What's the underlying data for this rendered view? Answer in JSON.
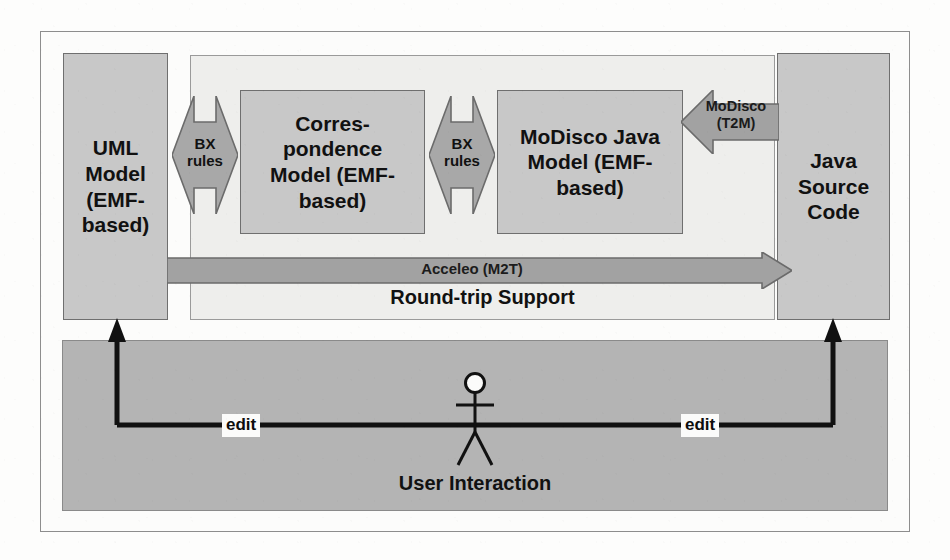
{
  "diagram": {
    "colors": {
      "page_background": "#fdfdfc",
      "model_box_fill": "#c8c8c8",
      "model_box_stroke": "#6f6f6f",
      "container_fill": "#eeeeec",
      "container_stroke": "#9a9a9a",
      "arrow_fill": "#a8a8a8",
      "arrow_stroke": "#6b6b6b",
      "band_fill": "#b4b4b4",
      "band_stroke": "#8a8a8a",
      "connector_stroke": "#111111",
      "text": "#111111"
    },
    "boxes": [
      {
        "id": "uml",
        "label": "UML\nModel\n(EMF-\nbased)"
      },
      {
        "id": "corr",
        "label": "Corres-\npondence\nModel (EMF-\nbased)"
      },
      {
        "id": "modisco",
        "label": "MoDisco Java\nModel (EMF-\nbased)"
      },
      {
        "id": "java",
        "label": "Java\nSource\nCode"
      }
    ],
    "container": {
      "caption": "Round-trip Support"
    },
    "arrows": [
      {
        "id": "bx-1",
        "label": "BX\nrules",
        "kind": "bidirectional"
      },
      {
        "id": "bx-2",
        "label": "BX\nrules",
        "kind": "bidirectional"
      },
      {
        "id": "modisco",
        "label": "MoDisco\n(T2M)",
        "kind": "left"
      },
      {
        "id": "acceleo",
        "label": "Acceleo (M2T)",
        "kind": "right"
      }
    ],
    "user_band": {
      "actor_label": "User Interaction",
      "edit_label_left": "edit",
      "edit_label_right": "edit"
    }
  }
}
